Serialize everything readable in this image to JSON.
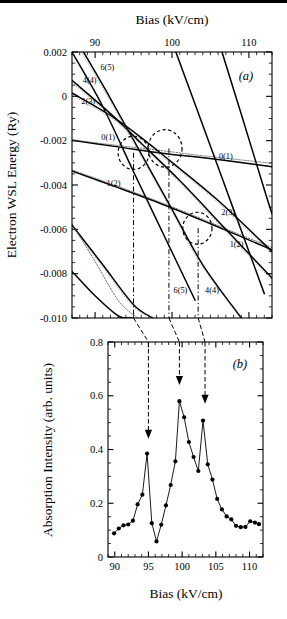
{
  "figure": {
    "panels": [
      "a",
      "b"
    ],
    "panel_a_label": "(a)",
    "panel_b_label": "(b)"
  },
  "panel_a": {
    "top_axis_title": "Bias (kV/cm)",
    "y_axis_title": "Electron WSL Energy (Ry)",
    "x_ticks": [
      "90",
      "100",
      "110"
    ],
    "x_tick_values": [
      90,
      100,
      110
    ],
    "y_ticks": [
      "0.002",
      "0",
      "-0.002",
      "-0.004",
      "-0.006",
      "-0.008",
      "-0.010"
    ],
    "y_tick_values": [
      0.002,
      0,
      -0.002,
      -0.004,
      -0.006,
      -0.008,
      -0.01
    ],
    "curve_labels_left": [
      "6(5)",
      "4(4)",
      "2(3)",
      "0(1)"
    ],
    "curve_labels_right": [
      "0(1)",
      "2(3)",
      "1(2)"
    ],
    "curve_labels_other": [
      "1(2)",
      "6(5)",
      "4(4)"
    ],
    "anticrossing_markers": 3,
    "marker_biases": [
      95.0,
      99.6,
      103.4
    ]
  },
  "panel_b": {
    "x_axis_title": "Bias (kV/cm)",
    "y_axis_title": "Absorption Intensity  (arb. units)",
    "x_ticks": [
      "90",
      "95",
      "100",
      "105",
      "110"
    ],
    "x_tick_values": [
      90,
      95,
      100,
      105,
      110
    ],
    "y_ticks": [
      "0.8",
      "0.6",
      "0.4",
      "0.2",
      "0"
    ],
    "y_tick_values": [
      0.8,
      0.6,
      0.4,
      0.2,
      0
    ],
    "arrow_biases": [
      95.0,
      99.6,
      103.4
    ]
  },
  "chart_data": [
    {
      "type": "line",
      "panel": "a",
      "title": "",
      "xlabel": "Bias (kV/cm)",
      "ylabel": "Electron WSL Energy (Ry)",
      "xlim": [
        87,
        113
      ],
      "ylim": [
        -0.01,
        0.002
      ],
      "grid": false,
      "legend": "none",
      "axis_position": "x-top",
      "annotations": [
        {
          "text": "(a)",
          "x": 109.5,
          "y": 0.0011
        },
        {
          "text": "6(5)",
          "x": 91.6,
          "y": 0.0012
        },
        {
          "text": "4(4)",
          "x": 89.3,
          "y": 0.00062
        },
        {
          "text": "2(3)",
          "x": 89.1,
          "y": -0.00035
        },
        {
          "text": "0(1)",
          "x": 91.7,
          "y": -0.00195
        },
        {
          "text": "0(1)",
          "x": 107.0,
          "y": -0.00284
        },
        {
          "text": "1(2)",
          "x": 92.4,
          "y": -0.00405
        },
        {
          "text": "2(3)",
          "x": 107.3,
          "y": -0.00535
        },
        {
          "text": "1(2)",
          "x": 108.4,
          "y": -0.00678
        },
        {
          "text": "6(5)",
          "x": 101.1,
          "y": -0.00886
        },
        {
          "text": "4(4)",
          "x": 105.2,
          "y": -0.00886
        }
      ],
      "anticrossing_circles": [
        {
          "x": 95.0,
          "y": -0.00255,
          "rx": 2.0,
          "ry": 0.00075
        },
        {
          "x": 99.1,
          "y": -0.00235,
          "rx": 2.2,
          "ry": 0.00085
        },
        {
          "x": 103.3,
          "y": -0.00595,
          "rx": 1.9,
          "ry": 0.00072
        }
      ],
      "vertical_markers": [
        95.0,
        99.6,
        103.4
      ],
      "series": [
        {
          "name": "0(1)",
          "style": "solid",
          "x": [
            87,
            93,
            97,
            100,
            103,
            107,
            113
          ],
          "y": [
            -0.00198,
            -0.00228,
            -0.00249,
            -0.00262,
            -0.00272,
            -0.00289,
            -0.00318
          ]
        },
        {
          "name": "0(1)-dotted",
          "style": "dotted",
          "x": [
            87,
            93,
            98,
            104,
            113
          ],
          "y": [
            -0.00196,
            -0.00222,
            -0.00242,
            -0.00268,
            -0.00302
          ]
        },
        {
          "name": "1(2)",
          "style": "solid",
          "x": [
            87,
            93,
            99,
            105,
            113
          ],
          "y": [
            -0.00337,
            -0.00412,
            -0.0049,
            -0.00575,
            -0.00692
          ]
        },
        {
          "name": "1(2)-dotted",
          "style": "dotted",
          "x": [
            87,
            94,
            101,
            108,
            113
          ],
          "y": [
            -0.00332,
            -0.00419,
            -0.00512,
            -0.00612,
            -0.00682
          ]
        },
        {
          "name": "2(3)",
          "style": "solid",
          "x": [
            87,
            92,
            96,
            100,
            106,
            113
          ],
          "y": [
            0.00015,
            -0.00086,
            -0.00186,
            -0.00298,
            -0.0047,
            -0.007
          ]
        },
        {
          "name": "4(4)",
          "style": "solid",
          "x": [
            87,
            92,
            96,
            101,
            107,
            113
          ],
          "y": [
            0.00072,
            -0.00078,
            -0.00212,
            -0.0038,
            -0.006,
            -0.0082
          ]
        },
        {
          "name": "6(5)",
          "style": "solid",
          "x": [
            88.5,
            92,
            96,
            100,
            104,
            109
          ],
          "y": [
            0.002,
            -0.0001,
            -0.0026,
            -0.0051,
            -0.0076,
            -0.01
          ]
        },
        {
          "name": "6(5)-b",
          "style": "solid",
          "x": [
            87.0,
            91,
            95,
            99,
            103
          ],
          "y": [
            0.002,
            -0.00046,
            -0.0034,
            -0.0063,
            -0.0092
          ]
        },
        {
          "name": "steep-1",
          "style": "solid",
          "x": [
            100.5,
            104,
            108,
            112
          ],
          "y": [
            0.002,
            -0.0013,
            -0.0051,
            -0.0089
          ]
        },
        {
          "name": "steep-2",
          "style": "solid",
          "x": [
            106.5,
            109,
            112,
            113
          ],
          "y": [
            0.002,
            -0.0008,
            -0.0042,
            -0.0053
          ]
        },
        {
          "name": "low-1",
          "style": "solid",
          "x": [
            87,
            91,
            95,
            97.5
          ],
          "y": [
            -0.0058,
            -0.0076,
            -0.0094,
            -0.01
          ]
        },
        {
          "name": "low-2",
          "style": "solid",
          "x": [
            87,
            90,
            93,
            94.8
          ],
          "y": [
            -0.0079,
            -0.009,
            -0.0099,
            -0.01
          ]
        },
        {
          "name": "low-3",
          "style": "dotted",
          "x": [
            87,
            90,
            93,
            95.5
          ],
          "y": [
            -0.00575,
            -0.00745,
            -0.0092,
            -0.01
          ]
        }
      ]
    },
    {
      "type": "line",
      "panel": "b",
      "title": "",
      "xlabel": "Bias (kV/cm)",
      "ylabel": "Absorption Intensity  (arb. units)",
      "xlim": [
        89,
        112
      ],
      "ylim": [
        0,
        0.8
      ],
      "grid": false,
      "legend": "none",
      "markers": "filled-circle",
      "x": [
        89.9,
        90.6,
        91.3,
        92.0,
        92.7,
        93.4,
        94.1,
        94.8,
        95.5,
        96.2,
        96.9,
        97.6,
        98.3,
        99.0,
        99.6,
        100.3,
        101.0,
        101.7,
        102.4,
        103.1,
        103.8,
        104.5,
        105.2,
        105.9,
        106.6,
        107.3,
        108.0,
        108.7,
        109.4,
        110.1,
        110.8,
        111.4
      ],
      "y": [
        0.088,
        0.106,
        0.118,
        0.121,
        0.135,
        0.196,
        0.232,
        0.385,
        0.126,
        0.058,
        0.12,
        0.192,
        0.268,
        0.356,
        0.58,
        0.52,
        0.428,
        0.372,
        0.32,
        0.508,
        0.345,
        0.288,
        0.216,
        0.177,
        0.151,
        0.14,
        0.116,
        0.111,
        0.112,
        0.133,
        0.128,
        0.122
      ],
      "arrows": [
        {
          "x": 95.0,
          "y_tip": 0.44
        },
        {
          "x": 99.6,
          "y_tip": 0.64
        },
        {
          "x": 103.4,
          "y_tip": 0.57
        }
      ]
    }
  ]
}
